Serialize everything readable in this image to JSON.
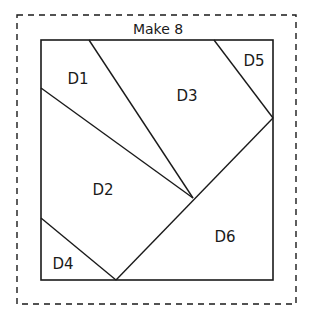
{
  "title": "Make 8",
  "colors": {
    "line": "#1a1a1a",
    "background": "#ffffff"
  },
  "seam_allowance": {
    "style": "dashed",
    "x": 17,
    "y": 15,
    "width": 279,
    "height": 289
  },
  "block": {
    "x": 41,
    "y": 40,
    "width": 232,
    "height": 240
  },
  "pieces": [
    {
      "id": "D1",
      "label": "D1",
      "x": 68,
      "y": 85
    },
    {
      "id": "D2",
      "label": "D2",
      "x": 102,
      "y": 193
    },
    {
      "id": "D3",
      "label": "D3",
      "x": 187,
      "y": 101
    },
    {
      "id": "D4",
      "label": "D4",
      "x": 62,
      "y": 270
    },
    {
      "id": "D5",
      "label": "D5",
      "x": 253,
      "y": 64
    },
    {
      "id": "D6",
      "label": "D6",
      "x": 225,
      "y": 240
    }
  ]
}
